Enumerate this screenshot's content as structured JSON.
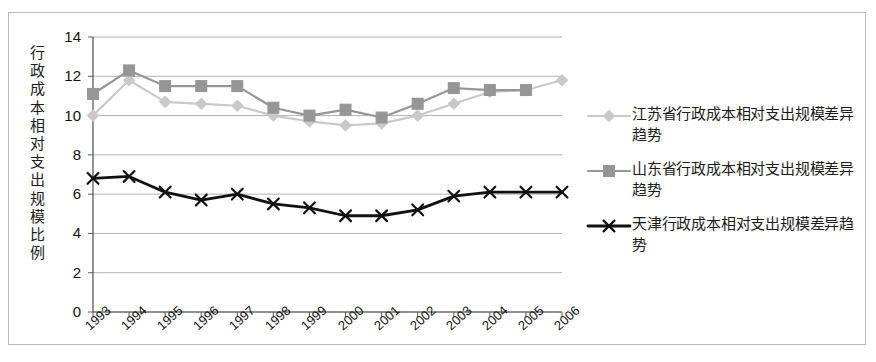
{
  "chart_data": {
    "type": "line",
    "title": "",
    "xlabel": "",
    "ylabel": "行政成本相对支出规模比例",
    "categories": [
      "1993",
      "1994",
      "1995",
      "1996",
      "1997",
      "1998",
      "1999",
      "2000",
      "2001",
      "2002",
      "2003",
      "2004",
      "2005",
      "2006"
    ],
    "ylim": [
      0,
      14
    ],
    "ytick_values": [
      0,
      2,
      4,
      6,
      8,
      10,
      12,
      14
    ],
    "ytick_labels": [
      "0",
      "2",
      "4",
      "6",
      "8",
      "10",
      "12",
      "14"
    ],
    "grid": true,
    "grid_axis": "y",
    "legend_position": "right",
    "series": [
      {
        "name": "江苏省行政成本相对支出规模差异趋势",
        "color": "#c9c9c9",
        "marker": "diamond",
        "values": [
          10.0,
          11.8,
          10.7,
          10.6,
          10.5,
          10.0,
          9.7,
          9.5,
          9.6,
          10.0,
          10.6,
          11.2,
          11.3,
          11.8
        ]
      },
      {
        "name": "山东省行政成本相对支出规模差异趋势",
        "color": "#969696",
        "marker": "square",
        "values": [
          11.1,
          12.3,
          11.5,
          11.5,
          11.5,
          10.4,
          10.0,
          10.3,
          9.9,
          10.6,
          11.4,
          11.3,
          11.3,
          null
        ]
      },
      {
        "name": "天津行政成本相对支出规模差异趋势",
        "color": "#111111",
        "marker": "x",
        "values": [
          6.8,
          6.9,
          6.1,
          5.7,
          6.0,
          5.5,
          5.3,
          4.9,
          4.9,
          5.2,
          5.9,
          6.1,
          6.1,
          6.1
        ]
      }
    ]
  },
  "axis": {
    "y_title": "行政成本相对支出规模比例"
  },
  "legend": {
    "items": [
      {
        "label": "江苏省行政成本相对支出规模差异趋势",
        "color": "#c9c9c9",
        "marker": "diamond"
      },
      {
        "label": "山东省行政成本相对支出规模差异趋势",
        "color": "#969696",
        "marker": "square"
      },
      {
        "label": "天津行政成本相对支出规模差异趋势",
        "color": "#111111",
        "marker": "x"
      }
    ]
  }
}
